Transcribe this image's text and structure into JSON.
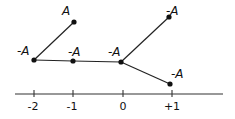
{
  "diagram": {
    "type": "tree-on-number-line",
    "axis": {
      "ticks": [
        {
          "label": "-2",
          "x": 34
        },
        {
          "label": "-1",
          "x": 73
        },
        {
          "label": "0",
          "x": 123
        },
        {
          "label": "+1",
          "x": 172
        }
      ]
    },
    "nodes": [
      {
        "id": "n1",
        "label": "A",
        "x": 74,
        "y": 22,
        "lx": 62,
        "ly": 4
      },
      {
        "id": "n2",
        "label": "-A",
        "x": 34,
        "y": 60,
        "lx": 18,
        "ly": 45
      },
      {
        "id": "n3",
        "label": "-A",
        "x": 73,
        "y": 61,
        "lx": 67,
        "ly": 46
      },
      {
        "id": "n4",
        "label": "-A",
        "x": 121,
        "y": 62,
        "lx": 108,
        "ly": 46
      },
      {
        "id": "n5",
        "label": "-A",
        "x": 169,
        "y": 17,
        "lx": 166,
        "ly": 4
      },
      {
        "id": "n6",
        "label": "-A",
        "x": 170,
        "y": 84,
        "lx": 170,
        "ly": 68
      }
    ],
    "edges": [
      [
        "n2",
        "n1"
      ],
      [
        "n2",
        "n3"
      ],
      [
        "n3",
        "n4"
      ],
      [
        "n4",
        "n5"
      ],
      [
        "n4",
        "n6"
      ]
    ],
    "colors": {
      "line": "#222222",
      "node": "#111111"
    }
  },
  "labels": {
    "n1": "A",
    "n2": "-A",
    "n3": "-A",
    "n4": "-A",
    "n5": "-A",
    "n6": "-A",
    "tick_m2": "-2",
    "tick_m1": "-1",
    "tick_0": "0",
    "tick_p1": "+1"
  }
}
